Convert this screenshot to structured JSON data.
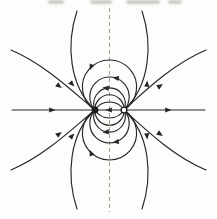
{
  "figure": {
    "kind": "dipole-field-line-diagram",
    "canvas": {
      "width": 217,
      "height": 219
    },
    "colors": {
      "line": "#262626",
      "axis_dash": "#a0a099",
      "paper": "#fdfdfb",
      "charge_fill": "#1b1b1b",
      "charge_open_fill": "#ffffff"
    },
    "axis": {
      "name": "symmetry-axis-dashed",
      "d": "M 109.5 8 V 212",
      "dash": "4 3",
      "width": 1
    },
    "charges": [
      {
        "name": "charge-filled",
        "role": "field-sink",
        "x": 95,
        "y": 110,
        "r": 3.4,
        "style": "filled"
      },
      {
        "name": "charge-open",
        "role": "field-source",
        "x": 124,
        "y": 110,
        "r": 2.9,
        "style": "open",
        "stroke_width": 1.3
      }
    ],
    "field_lines": {
      "stroke_width": 1.15,
      "paths": [
        {
          "name": "axis-field-line-horizontal",
          "d": "M 12 110 H 205"
        },
        {
          "name": "closed-loop-1-upper",
          "d": "M 95 110 A 27.1 27.1 0 1 1 124 110"
        },
        {
          "name": "closed-loop-1-lower",
          "d": "M 95 110 A 27.1 27.1 0 1 0 124 110"
        },
        {
          "name": "closed-loop-2-upper",
          "d": "M 95 110 A 19.7 19.7 0 1 1 124 110"
        },
        {
          "name": "closed-loop-2-lower",
          "d": "M 95 110 A 19.7 19.7 0 1 0 124 110"
        },
        {
          "name": "closed-loop-3-upper",
          "d": "M 95 110 A 15.8 15.8 0 1 1 124 110"
        },
        {
          "name": "closed-loop-3-lower",
          "d": "M 95 110 A 15.8 15.8 0 1 0 124 110"
        },
        {
          "name": "closed-loop-4-upper",
          "d": "M 95 110 A 14.52 14.52 0 1 1 124 110"
        },
        {
          "name": "closed-loop-4-lower",
          "d": "M 95 110 A 14.52 14.52 0 1 0 124 110"
        },
        {
          "name": "closed-loop-5-upper",
          "d": "M 95 110 A 17.14 17.14 0 0 1 124 110"
        },
        {
          "name": "closed-loop-5-lower",
          "d": "M 95 110 A 17.14 17.14 0 0 0 124 110"
        },
        {
          "name": "open-line-upper-left-vertical",
          "d": "M 77 11 C 66 44 69 86 95 110"
        },
        {
          "name": "open-line-upper-right-vertical",
          "d": "M 142 11 C 153 44 150 86 124 110"
        },
        {
          "name": "open-line-lower-left-vertical",
          "d": "M 77 209 C 66 176 69 134 95 110"
        },
        {
          "name": "open-line-lower-right-vertical",
          "d": "M 142 209 C 153 176 150 134 124 110"
        },
        {
          "name": "open-line-upper-left-diagonal",
          "d": "M 11 50 C 44 64 71 90 95 110"
        },
        {
          "name": "open-line-upper-right-diagonal",
          "d": "M 206 50 C 173 64 146 90 124 110"
        },
        {
          "name": "open-line-lower-left-diagonal",
          "d": "M 11 170 C 44 156 71 130 95 110"
        },
        {
          "name": "open-line-lower-right-diagonal",
          "d": "M 206 170 C 173 156 146 130 124 110"
        }
      ]
    },
    "flow_arrows": {
      "shape": "M 3.5 0 L -2.8 2.6 L -2.8 -2.6 Z",
      "items": [
        {
          "name": "arrow-axis-left",
          "x": 52,
          "y": 110,
          "angle": 0
        },
        {
          "name": "arrow-axis-right",
          "x": 168,
          "y": 110,
          "angle": 0
        },
        {
          "name": "arrow-axis-center",
          "x": 109,
          "y": 110,
          "angle": 180
        },
        {
          "name": "arrow-loop1-upper-left",
          "x": 91,
          "y": 67,
          "angle": 114
        },
        {
          "name": "arrow-loop1-lower-left",
          "x": 91,
          "y": 153,
          "angle": 246
        },
        {
          "name": "arrow-loop2-upper-right",
          "x": 116,
          "y": 78,
          "angle": 190
        },
        {
          "name": "arrow-loop2-lower-right",
          "x": 116,
          "y": 142,
          "angle": 170
        },
        {
          "name": "arrow-loop3-top",
          "x": 106,
          "y": 88,
          "angle": 187
        },
        {
          "name": "arrow-loop3-bottom",
          "x": 106,
          "y": 132,
          "angle": 173
        },
        {
          "name": "arrow-upper-left-vertical",
          "x": 72,
          "y": 84,
          "angle": 48
        },
        {
          "name": "arrow-lower-left-vertical",
          "x": 72,
          "y": 136,
          "angle": 312
        },
        {
          "name": "arrow-upper-left-diagonal",
          "x": 59,
          "y": 86,
          "angle": 35
        },
        {
          "name": "arrow-lower-left-diagonal",
          "x": 59,
          "y": 134,
          "angle": 325
        },
        {
          "name": "arrow-upper-right-vertical",
          "x": 147,
          "y": 84,
          "angle": 275
        },
        {
          "name": "arrow-lower-right-vertical",
          "x": 147,
          "y": 136,
          "angle": 85
        },
        {
          "name": "arrow-upper-right-diagonal",
          "x": 160,
          "y": 86,
          "angle": 327
        },
        {
          "name": "arrow-lower-right-diagonal",
          "x": 160,
          "y": 134,
          "angle": 33
        }
      ]
    },
    "artifacts": {
      "cropped_text_fragments": [
        {
          "x": 48,
          "w": 16
        },
        {
          "x": 90,
          "w": 22
        },
        {
          "x": 126,
          "w": 34
        },
        {
          "x": 168,
          "w": 14
        }
      ]
    }
  }
}
